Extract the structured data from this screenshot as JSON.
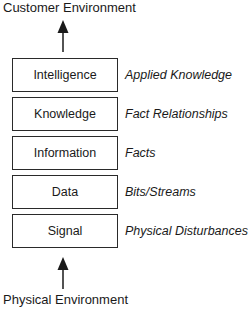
{
  "diagram": {
    "top_label": "Customer Environment",
    "bottom_label": "Physical Environment",
    "flow_direction": "upward",
    "layers": [
      {
        "name": "Intelligence",
        "description": "Applied Knowledge"
      },
      {
        "name": "Knowledge",
        "description": "Fact Relationships"
      },
      {
        "name": "Information",
        "description": "Facts"
      },
      {
        "name": "Data",
        "description": "Bits/Streams"
      },
      {
        "name": "Signal",
        "description": "Physical Disturbances"
      }
    ],
    "colors": {
      "stroke": "#2a2a2a",
      "text": "#1a1a1a",
      "background": "#ffffff"
    }
  }
}
